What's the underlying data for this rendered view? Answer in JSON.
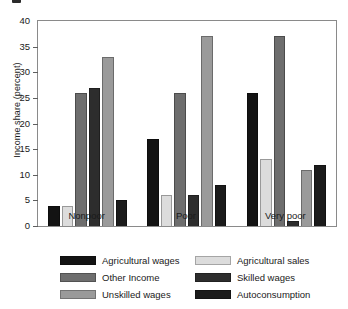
{
  "chart_data": {
    "type": "bar",
    "title": "",
    "xlabel": "",
    "ylabel": "Income share (percent)",
    "categories": [
      "Nonpoor",
      "Poor",
      "Very poor"
    ],
    "ylim": [
      0,
      40
    ],
    "yticks": [
      0,
      5,
      10,
      15,
      20,
      25,
      30,
      35,
      40
    ],
    "grid": false,
    "legend_position": "bottom",
    "series": [
      {
        "name": "Agricultural wages",
        "color": "#131313",
        "values": [
          4,
          17,
          26
        ]
      },
      {
        "name": "Agricultural sales",
        "color": "#dcdcdc",
        "values": [
          4,
          6,
          13
        ]
      },
      {
        "name": "Other Income",
        "color": "#6e6e6e",
        "values": [
          26,
          26,
          37
        ]
      },
      {
        "name": "Skilled wages",
        "color": "#2d2d2d",
        "values": [
          27,
          6,
          1
        ]
      },
      {
        "name": "Unskilled wages",
        "color": "#9a9a9a",
        "values": [
          33,
          37,
          11
        ]
      },
      {
        "name": "Autoconsumption",
        "color": "#1b1b1b",
        "values": [
          5,
          8,
          12
        ]
      }
    ]
  },
  "legend": {
    "items": [
      {
        "label": "Agricultural wages",
        "color": "#131313"
      },
      {
        "label": "Agricultural sales",
        "color": "#dcdcdc"
      },
      {
        "label": "Other Income",
        "color": "#6e6e6e"
      },
      {
        "label": "Skilled wages",
        "color": "#2d2d2d"
      },
      {
        "label": "Unskilled wages",
        "color": "#9a9a9a"
      },
      {
        "label": "Autoconsumption",
        "color": "#1b1b1b"
      }
    ]
  }
}
